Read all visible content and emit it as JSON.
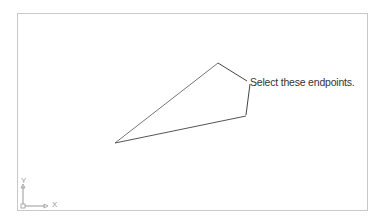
{
  "drawing": {
    "callout": "Select these endpoints.",
    "ucs": {
      "x_label": "X",
      "y_label": "Y"
    },
    "lines": [
      {
        "from": [
          115,
          143
        ],
        "to": [
          218,
          63
        ]
      },
      {
        "from": [
          218,
          63
        ],
        "to": [
          247,
          81
        ]
      },
      {
        "from": [
          250,
          84
        ],
        "to": [
          246,
          115
        ]
      },
      {
        "from": [
          246,
          116
        ],
        "to": [
          115,
          143
        ]
      }
    ],
    "colors": {
      "line": "#555555",
      "frame": "#c8c8c8",
      "ucs": "#999999"
    }
  }
}
